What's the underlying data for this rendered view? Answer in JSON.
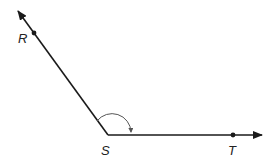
{
  "diagram": {
    "type": "angle",
    "colors": {
      "stroke": "#1a1a1a",
      "arc": "#555555",
      "background": "#ffffff"
    },
    "points": {
      "R": {
        "label": "R"
      },
      "S": {
        "label": "S"
      },
      "T": {
        "label": "T"
      }
    },
    "rays": [
      {
        "from": "S",
        "through": "R"
      },
      {
        "from": "S",
        "through": "T"
      }
    ]
  }
}
